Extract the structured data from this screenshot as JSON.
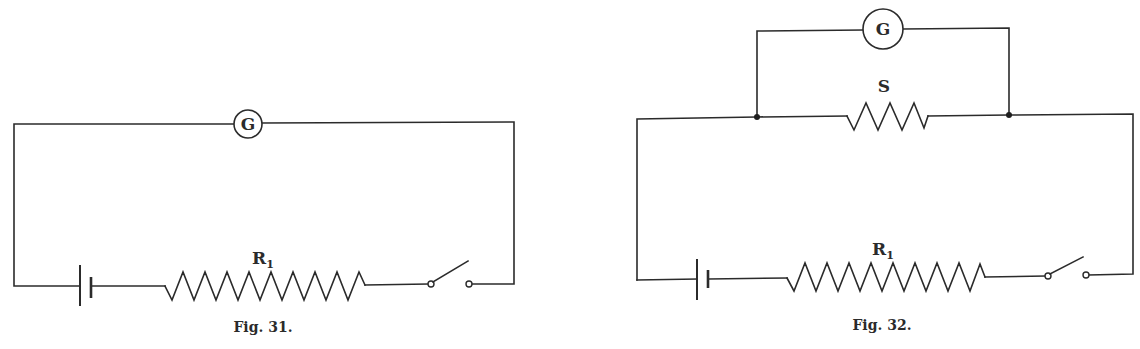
{
  "figures": [
    {
      "id": "fig31",
      "caption": "Fig. 31.",
      "galvanometer": {
        "label": "G"
      },
      "resistor": {
        "label": "R",
        "subscript": "1"
      },
      "components": [
        "galvanometer",
        "battery",
        "resistor R1",
        "switch (open)"
      ],
      "connection": "series"
    },
    {
      "id": "fig32",
      "caption": "Fig. 32.",
      "galvanometer": {
        "label": "G"
      },
      "shunt": {
        "label": "S"
      },
      "resistor": {
        "label": "R",
        "subscript": "1"
      },
      "components": [
        "galvanometer",
        "shunt S (parallel with G)",
        "battery",
        "resistor R1",
        "switch (open)"
      ],
      "connection": "galvanometer shunted by S, in series with battery, R1 and switch"
    }
  ],
  "colors": {
    "ink": "#2b2b2b",
    "background": "#ffffff"
  }
}
